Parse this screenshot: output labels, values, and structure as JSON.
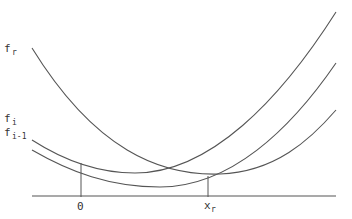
{
  "diagram": {
    "curves": [
      {
        "name": "f_r",
        "label": "f",
        "subscript": "r"
      },
      {
        "name": "f_i",
        "label": "f",
        "subscript": "i"
      },
      {
        "name": "f_i-1",
        "label": "f",
        "subscript": "i-1"
      }
    ],
    "axis_ticks": [
      {
        "label": "0"
      },
      {
        "label": "x",
        "subscript": "r"
      }
    ]
  }
}
